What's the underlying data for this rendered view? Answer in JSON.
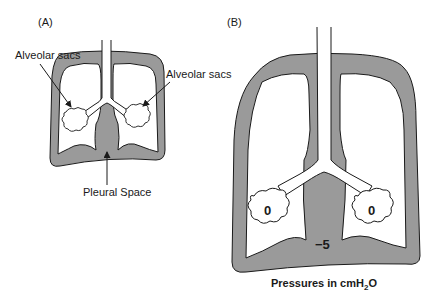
{
  "panels": {
    "a": {
      "label": "(A)",
      "sac_label_left": "Alveolar sacs",
      "sac_label_right": "Alveolar sacs",
      "pleural_label": "Pleural Space"
    },
    "b": {
      "label": "(B)",
      "pressure_left": "0",
      "pressure_right": "0",
      "pressure_pleural": "−5",
      "caption_prefix": "Pressures in cmH",
      "caption_sub": "2",
      "caption_suffix": "O"
    }
  },
  "colors": {
    "pleural_fill": "#9a9a9a",
    "lung_fill": "#ffffff",
    "stroke": "#1a1a1a"
  }
}
